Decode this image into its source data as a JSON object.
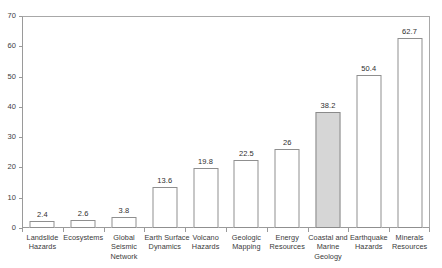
{
  "chart_data": {
    "type": "bar",
    "title": "",
    "subtitle": "",
    "xlabel": "",
    "ylabel": "",
    "ylim": [
      0,
      70
    ],
    "ytick_step": 10,
    "yticks": [
      0,
      10,
      20,
      30,
      40,
      50,
      60,
      70
    ],
    "ytick_labels": [
      "0",
      "10",
      "20",
      "30",
      "40",
      "50",
      "60",
      "70"
    ],
    "grid": false,
    "legend": false,
    "legend_position": "none",
    "categories": [
      "Landslide Hazards",
      "Ecosystems",
      "Global Seismic Network",
      "Earth Surface Dynamics",
      "Volcano Hazards",
      "Geologic Mapping",
      "Energy Resources",
      "Coastal and Marine Geology",
      "Earthquake Hazards",
      "Minerals Resources"
    ],
    "values": [
      2.4,
      2.6,
      3.8,
      13.6,
      19.8,
      22.5,
      26,
      38.2,
      50.4,
      62.7
    ],
    "value_labels": [
      "2.4",
      "2.6",
      "3.8",
      "13.6",
      "19.8",
      "22.5",
      "26",
      "38.2",
      "50.4",
      "62.7"
    ],
    "highlight_index": 7,
    "colors": {
      "bar_fill": "#ffffff",
      "bar_edge": "#8f8f8f",
      "highlight_fill": "#d6d6d6",
      "highlight_edge": "#8a8a8a",
      "axis": "#9a9a9a",
      "text": "#3a3a3a",
      "background": "#ffffff"
    },
    "category_label_lines": [
      [
        "Landslide",
        "Hazards"
      ],
      [
        "Ecosystems"
      ],
      [
        "Global",
        "Seismic",
        "Network"
      ],
      [
        "Earth Surface",
        "Dynamics"
      ],
      [
        "Volcano",
        "Hazards"
      ],
      [
        "Geologic",
        "Mapping"
      ],
      [
        "Energy",
        "Resources"
      ],
      [
        "Coastal and",
        "Marine",
        "Geology"
      ],
      [
        "Earthquake",
        "Hazards"
      ],
      [
        "Minerals",
        "Resources"
      ]
    ]
  }
}
